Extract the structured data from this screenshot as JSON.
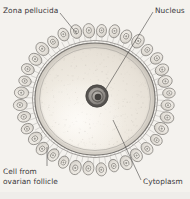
{
  "figure": {
    "style": "grayscale engraving / line drawing",
    "background_color": "#f4f2ee",
    "ink_color": "#39373a",
    "labels": {
      "zona_pellucida": "Zona pellucida",
      "nucleus": "Nucleus",
      "cytoplasm": "Cytoplasm",
      "cell_from_ovarian_follicle_line1": "Cell from",
      "cell_from_ovarian_follicle_line2": "ovarian follicle"
    },
    "structures": {
      "ovum": {
        "name": "ovum",
        "fill_color": "#efeae1",
        "outline_color": "#6c6a68",
        "center_x": 95,
        "center_y": 99,
        "radius_x": 62,
        "radius_y": 58
      },
      "zona_pellucida": {
        "name": "zona-pellucida",
        "color": "#8e8b87",
        "band_thickness": 7,
        "striation_count": 96
      },
      "nucleus": {
        "name": "nucleus",
        "outer_ring_color": "#4d4a48",
        "inner_fill_color": "#97938e",
        "center_x": 97,
        "center_y": 96,
        "radius": 11
      },
      "nucleolus": {
        "name": "nucleolus",
        "color": "#3a3836",
        "center_x": 98,
        "center_y": 97,
        "radius": 3.4
      },
      "follicle_cells": {
        "name": "follicle-cells",
        "count": 36,
        "fill_color": "#e4e0da",
        "outline_color": "#76736f",
        "nucleus_color": "#8c8984"
      },
      "corona_radiata": {
        "name": "corona-radiata",
        "color": "#8a8783",
        "process_count": 72
      }
    },
    "leaders": {
      "zona_pellucida": {
        "x1": 60,
        "y1": 13,
        "x2": 77,
        "y2": 33
      },
      "nucleus": {
        "x1": 153,
        "y1": 12,
        "x2": 104,
        "y2": 92
      },
      "cytoplasm": {
        "x1": 141,
        "y1": 180,
        "x2": 113,
        "y2": 120
      },
      "cell_follicle": {
        "x1": 47,
        "y1": 165,
        "x2": 47,
        "y2": 147
      }
    }
  }
}
